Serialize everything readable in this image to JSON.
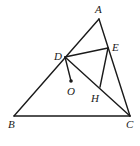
{
  "diagram": {
    "type": "geometry-figure",
    "points": {
      "A": {
        "label": "A",
        "x": 99,
        "y": 19
      },
      "B": {
        "label": "B",
        "x": 14,
        "y": 116
      },
      "C": {
        "label": "C",
        "x": 130,
        "y": 116
      },
      "D": {
        "label": "D",
        "x": 65,
        "y": 57
      },
      "E": {
        "label": "E",
        "x": 108,
        "y": 48
      },
      "O": {
        "label": "O",
        "x": 71,
        "y": 81
      },
      "H": {
        "label": "H",
        "x": 100,
        "y": 87
      }
    },
    "segments": [
      [
        "A",
        "B"
      ],
      [
        "A",
        "C"
      ],
      [
        "B",
        "C"
      ],
      [
        "D",
        "E"
      ],
      [
        "D",
        "C"
      ],
      [
        "E",
        "H"
      ],
      [
        "D",
        "O"
      ]
    ],
    "marked_points": [
      "O"
    ],
    "labels": {
      "A": "A",
      "B": "B",
      "C": "C",
      "D": "D",
      "E": "E",
      "O": "O",
      "H": "H"
    }
  }
}
